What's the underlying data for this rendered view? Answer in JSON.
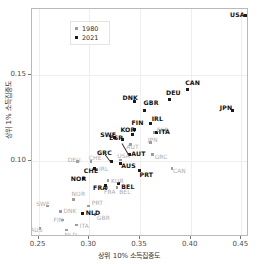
{
  "chart_data": {
    "type": "scatter",
    "title": "",
    "xlabel": "상위 10% 소득집중도",
    "ylabel": "상위 1% 소득집중도",
    "xlim": [
      0.2435,
      0.4575
    ],
    "ylim": [
      0.0555,
      0.1885
    ],
    "xticks": [
      0.25,
      0.3,
      0.35,
      0.4,
      0.45
    ],
    "xticklabels": [
      "0.25",
      "0.30",
      "0.35",
      "0.40",
      "0.45"
    ],
    "yticks": [
      0.1,
      0.15
    ],
    "yticklabels": [
      "0.10",
      "0.15"
    ],
    "grid": true,
    "legend_position": "top-left",
    "series": [
      {
        "name": "1980",
        "color": "#9c9c9c",
        "points": [
          {
            "label": "AUS",
            "x": 0.2515,
            "y": 0.0605
          },
          {
            "label": "SWE",
            "x": 0.2585,
            "y": 0.0735
          },
          {
            "label": "DNK",
            "x": 0.2715,
            "y": 0.0705
          },
          {
            "label": "FIN",
            "x": 0.2735,
            "y": 0.0655
          },
          {
            "label": "NLD",
            "x": 0.2775,
            "y": 0.0595
          },
          {
            "label": "ITA",
            "x": 0.2875,
            "y": 0.0625
          },
          {
            "label": "NOR",
            "x": 0.2845,
            "y": 0.0775
          },
          {
            "label": "PRT",
            "x": 0.2995,
            "y": 0.0735
          },
          {
            "label": "GBR",
            "x": 0.3055,
            "y": 0.0685
          },
          {
            "label": "DEU",
            "x": 0.2885,
            "y": 0.0995
          },
          {
            "label": "CHE",
            "x": 0.3015,
            "y": 0.0995
          },
          {
            "label": "IRL",
            "x": 0.3075,
            "y": 0.0945
          },
          {
            "label": "KOR",
            "x": 0.3185,
            "y": 0.0885
          },
          {
            "label": "FRA",
            "x": 0.3175,
            "y": 0.0845
          },
          {
            "label": "BEL",
            "x": 0.3275,
            "y": 0.0845
          },
          {
            "label": "USA",
            "x": 0.3305,
            "y": 0.1005
          },
          {
            "label": "AUT",
            "x": 0.3405,
            "y": 0.1095
          },
          {
            "label": "GRC",
            "x": 0.3625,
            "y": 0.1035
          },
          {
            "label": "JPN",
            "x": 0.3605,
            "y": 0.1105
          },
          {
            "label": "ESP",
            "x": 0.3645,
            "y": 0.1165
          },
          {
            "label": "CAN",
            "x": 0.3815,
            "y": 0.0955
          }
        ]
      },
      {
        "name": "2021",
        "color": "#1a1a1a",
        "points": [
          {
            "label": "NLD",
            "x": 0.2935,
            "y": 0.0695
          },
          {
            "label": "NOR",
            "x": 0.2945,
            "y": 0.0895
          },
          {
            "label": "CHE",
            "x": 0.3055,
            "y": 0.0955
          },
          {
            "label": "FRA",
            "x": 0.3155,
            "y": 0.0855
          },
          {
            "label": "BEL",
            "x": 0.3285,
            "y": 0.0865
          },
          {
            "label": "GRC",
            "x": 0.3215,
            "y": 0.0995
          },
          {
            "label": "AUS",
            "x": 0.3305,
            "y": 0.0985
          },
          {
            "label": "AUT",
            "x": 0.3395,
            "y": 0.1035
          },
          {
            "label": "PRT",
            "x": 0.3495,
            "y": 0.0945
          },
          {
            "label": "SWE",
            "x": 0.3245,
            "y": 0.1135
          },
          {
            "label": "ESP",
            "x": 0.3325,
            "y": 0.1125
          },
          {
            "label": "KOR",
            "x": 0.3425,
            "y": 0.1155
          },
          {
            "label": "FIN",
            "x": 0.3445,
            "y": 0.1185
          },
          {
            "label": "DNK",
            "x": 0.3445,
            "y": 0.1345
          },
          {
            "label": "GBR",
            "x": 0.3545,
            "y": 0.1295
          },
          {
            "label": "IRL",
            "x": 0.3605,
            "y": 0.1215
          },
          {
            "label": "ITA",
            "x": 0.3665,
            "y": 0.1165
          },
          {
            "label": "DEU",
            "x": 0.3795,
            "y": 0.1355
          },
          {
            "label": "CAN",
            "x": 0.3965,
            "y": 0.1415
          },
          {
            "label": "JPN",
            "x": 0.4415,
            "y": 0.1295
          },
          {
            "label": "USA",
            "x": 0.4545,
            "y": 0.1845
          }
        ]
      }
    ]
  },
  "legend": {
    "items": [
      {
        "label": "1980"
      },
      {
        "label": "2021"
      }
    ]
  }
}
